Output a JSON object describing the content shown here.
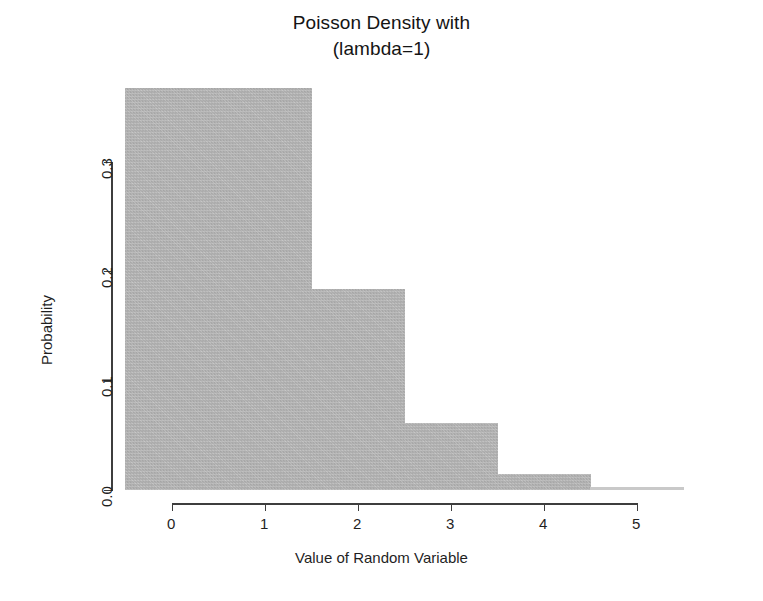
{
  "chart_data": {
    "type": "bar",
    "title": "Poisson Density with (lambda=1)",
    "title_lines": [
      "Poisson Density with",
      "(lambda=1)"
    ],
    "xlabel": "Value of Random Variable",
    "ylabel": "Probability",
    "categories": [
      "0",
      "1",
      "2",
      "3",
      "4",
      "5"
    ],
    "values": [
      0.368,
      0.368,
      0.184,
      0.061,
      0.015,
      0.003
    ],
    "x": [
      0,
      1,
      2,
      3,
      4,
      5
    ],
    "xtick_labels": [
      "0",
      "1",
      "2",
      "3",
      "4",
      "5"
    ],
    "ytick_labels": [
      "0.0",
      "0.1",
      "0.2",
      "0.3"
    ],
    "ytick_values": [
      0.0,
      0.1,
      0.2,
      0.3
    ],
    "xlim": [
      -0.5,
      5.5
    ],
    "ylim": [
      0,
      0.3
    ],
    "grid": false,
    "legend": false,
    "bar_color": "#b3b3b3",
    "axis_color": "#3d3d3d",
    "text_color": "#1f1f1f",
    "background": "#ffffff",
    "annotations": []
  },
  "figure": {
    "title_line1": "Poisson Density with",
    "title_line2": "(lambda=1)",
    "xaxis_title": "Value of Random Variable",
    "yaxis_title": "Probability",
    "xticks": [
      "0",
      "1",
      "2",
      "3",
      "4",
      "5"
    ],
    "yticks": [
      "0.0",
      "0.1",
      "0.2",
      "0.3"
    ]
  }
}
